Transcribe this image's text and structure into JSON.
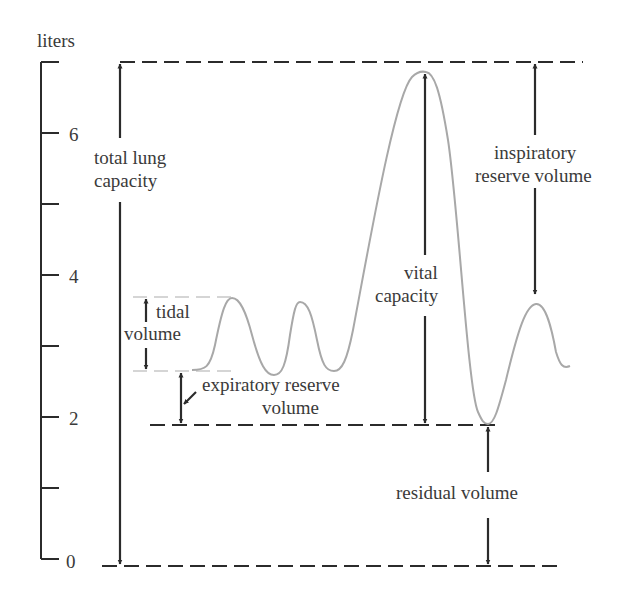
{
  "axis": {
    "unit_label": "liters",
    "ticks": [
      {
        "value": 7,
        "label": ""
      },
      {
        "value": 6,
        "label": "6"
      },
      {
        "value": 5,
        "label": ""
      },
      {
        "value": 4,
        "label": "4"
      },
      {
        "value": 3,
        "label": ""
      },
      {
        "value": 2,
        "label": "2"
      },
      {
        "value": 1,
        "label": ""
      },
      {
        "value": 0,
        "label": "0"
      }
    ]
  },
  "labels": {
    "total_lung_capacity_line1": "total lung",
    "total_lung_capacity_line2": "capacity",
    "tidal_volume_line1": "tidal",
    "tidal_volume_line2": "volume",
    "expiratory_reserve_line1": "expiratory reserve",
    "expiratory_reserve_line2": "volume",
    "vital_capacity_line1": "vital",
    "vital_capacity_line2": "capacity",
    "inspiratory_reserve_line1": "inspiratory",
    "inspiratory_reserve_line2": "reserve volume",
    "residual_volume": "residual volume"
  },
  "colors": {
    "ink": "#2b2b2b",
    "curve": "#a8a8a8",
    "guide": "#c8c8c8"
  }
}
